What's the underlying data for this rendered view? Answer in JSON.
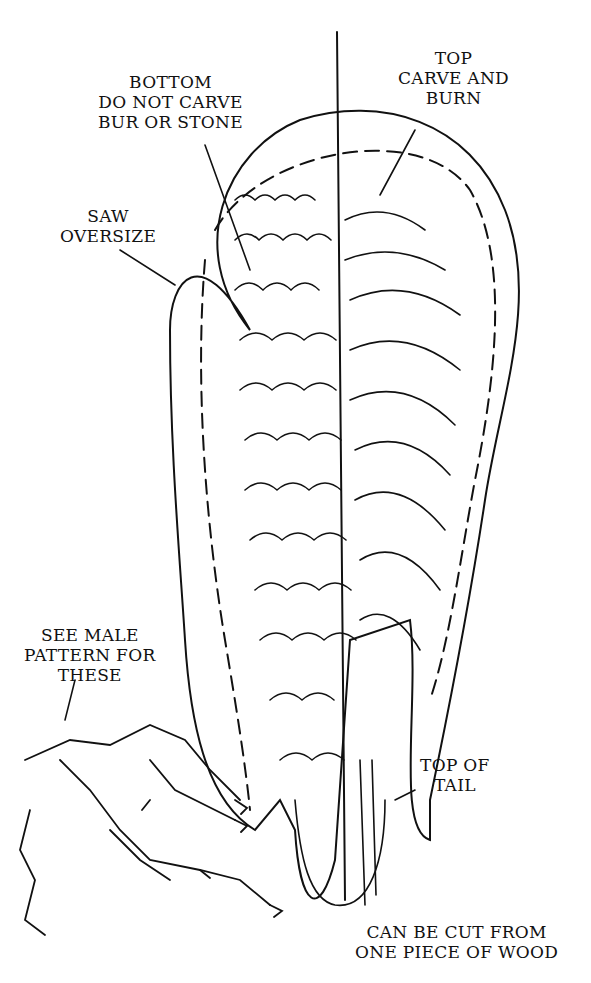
{
  "diagram": {
    "labels": {
      "bottom": [
        "BOTTOM",
        "DO NOT CARVE",
        "BUR OR STONE"
      ],
      "top": [
        "TOP",
        "CARVE AND",
        "BURN"
      ],
      "saw": [
        "SAW",
        "OVERSIZE"
      ],
      "male": [
        "SEE MALE",
        "PATTERN FOR",
        "THESE"
      ],
      "tail": [
        "TOP OF",
        "TAIL"
      ],
      "cut": [
        "CAN BE CUT FROM",
        "ONE PIECE OF WOOD"
      ]
    }
  }
}
